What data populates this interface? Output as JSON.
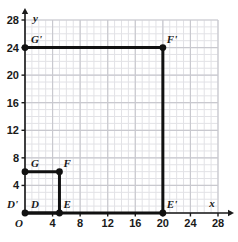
{
  "chart_data": {
    "type": "scatter",
    "title": "",
    "xlabel": "x",
    "ylabel": "y",
    "xlim": [
      0,
      28
    ],
    "ylim": [
      0,
      28
    ],
    "grid": true,
    "grid_minor_step": 1,
    "grid_major_step": 4,
    "legend": "none",
    "xticks": [
      "O",
      "4",
      "8",
      "12",
      "16",
      "20",
      "24",
      "28"
    ],
    "xtick_values": [
      0,
      4,
      8,
      12,
      16,
      20,
      24,
      28
    ],
    "yticks": [
      "4",
      "8",
      "12",
      "16",
      "20",
      "24",
      "28"
    ],
    "ytick_values": [
      4,
      8,
      12,
      16,
      20,
      24,
      28
    ],
    "origin_label": "O",
    "shapes": [
      {
        "name": "DEFG",
        "closed": false,
        "vertices": [
          {
            "label": "D",
            "x": 0,
            "y": 0,
            "label_dx": 6,
            "label_dy": -5
          },
          {
            "label": "E",
            "x": 5,
            "y": 0,
            "label_dx": 4,
            "label_dy": -5
          },
          {
            "label": "F",
            "x": 5,
            "y": 6,
            "label_dx": 4,
            "label_dy": -5
          },
          {
            "label": "G",
            "x": 0,
            "y": 6,
            "label_dx": 6,
            "label_dy": -5
          }
        ]
      },
      {
        "name": "D'E'F'G'",
        "closed": false,
        "vertices": [
          {
            "label": "D'",
            "x": 0,
            "y": 0,
            "label_dx": -18,
            "label_dy": -5
          },
          {
            "label": "E'",
            "x": 20,
            "y": 0,
            "label_dx": 4,
            "label_dy": -5
          },
          {
            "label": "F'",
            "x": 20,
            "y": 24,
            "label_dx": 4,
            "label_dy": -5
          },
          {
            "label": "G'",
            "x": 0,
            "y": 24,
            "label_dx": 6,
            "label_dy": -5
          }
        ]
      }
    ],
    "points": [
      {
        "label": "D",
        "x": 0,
        "y": 0
      },
      {
        "label": "E",
        "x": 5,
        "y": 0
      },
      {
        "label": "F",
        "x": 5,
        "y": 6
      },
      {
        "label": "G",
        "x": 0,
        "y": 6
      },
      {
        "label": "E'",
        "x": 20,
        "y": 0
      },
      {
        "label": "F'",
        "x": 20,
        "y": 24
      },
      {
        "label": "G'",
        "x": 0,
        "y": 24
      }
    ],
    "colors": {
      "shape_stroke": "#111111",
      "axis": "#1a1a1a",
      "grid_minor": "#e2e2e6",
      "grid_major": "#c9c9cf",
      "background": "#ffffff",
      "text": "#1a1a1a"
    }
  }
}
